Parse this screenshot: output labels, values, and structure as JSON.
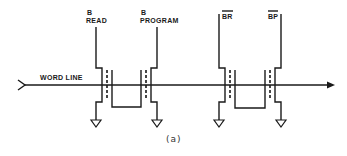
{
  "diagram": {
    "caption": "(a)",
    "word_line_label": "WORD LINE",
    "lines": {
      "read": {
        "top": "B",
        "bottom": "READ"
      },
      "program": {
        "top": "B",
        "bottom": "PROGRAM"
      },
      "br": {
        "label": "BR",
        "overline": true
      },
      "bp": {
        "label": "BP",
        "overline": true
      }
    },
    "colors": {
      "ink": "#1a1a1a",
      "background": "#ffffff"
    }
  }
}
